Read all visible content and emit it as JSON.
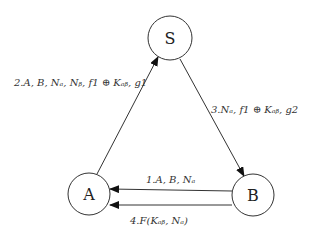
{
  "diagram": {
    "nodes": [
      {
        "id": "S",
        "label": "S",
        "cx": 170,
        "cy": 38,
        "r": 22
      },
      {
        "id": "A",
        "label": "A",
        "cx": 89,
        "cy": 194,
        "r": 21
      },
      {
        "id": "B",
        "label": "B",
        "cx": 253,
        "cy": 195,
        "r": 21
      }
    ],
    "edges": [
      {
        "id": "msg1",
        "from": "B",
        "to": "A",
        "label": "1.A, B, Nₐ"
      },
      {
        "id": "msg2",
        "from": "A",
        "to": "S",
        "label": "2.A, B, Nₐ, Nᵦ, f1 ⊕ Kₐᵦ, g1"
      },
      {
        "id": "msg3",
        "from": "S",
        "to": "B",
        "label": "3.Nₐ, f1 ⊕ Kₐᵦ, g2"
      },
      {
        "id": "msg4",
        "from": "B",
        "to": "A",
        "label": "4.F(Kₐᵦ, Nₐ)"
      }
    ]
  }
}
